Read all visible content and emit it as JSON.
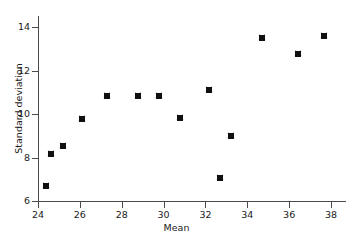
{
  "chart_data": {
    "type": "scatter",
    "title": "",
    "xlabel": "Mean",
    "ylabel": "Standard deviation",
    "xlim": [
      23.6,
      38.7
    ],
    "ylim": [
      6,
      14.6
    ],
    "grid": false,
    "legend": null,
    "xticks": [
      24,
      26,
      28,
      30,
      32,
      34,
      36,
      38
    ],
    "xtick_labels": [
      "24",
      "26",
      "28",
      "30",
      "32",
      "34",
      "36",
      "38"
    ],
    "yticks": [
      6,
      8,
      10,
      12,
      14
    ],
    "ytick_labels": [
      "6",
      "8",
      "10",
      "12",
      "14"
    ],
    "marker": "x-in-square",
    "marker_color": "#111111",
    "points": [
      {
        "x": 24.4,
        "y": 6.7
      },
      {
        "x": 24.6,
        "y": 8.15
      },
      {
        "x": 25.2,
        "y": 8.55
      },
      {
        "x": 26.1,
        "y": 9.75
      },
      {
        "x": 27.3,
        "y": 10.85
      },
      {
        "x": 28.8,
        "y": 10.85
      },
      {
        "x": 29.8,
        "y": 10.85
      },
      {
        "x": 30.8,
        "y": 9.8
      },
      {
        "x": 32.15,
        "y": 11.1
      },
      {
        "x": 32.7,
        "y": 7.05
      },
      {
        "x": 33.2,
        "y": 9.0
      },
      {
        "x": 34.7,
        "y": 13.5
      },
      {
        "x": 36.4,
        "y": 12.75
      },
      {
        "x": 37.65,
        "y": 13.6
      }
    ]
  },
  "axes": {
    "axis_color": "#4a4a4a"
  }
}
